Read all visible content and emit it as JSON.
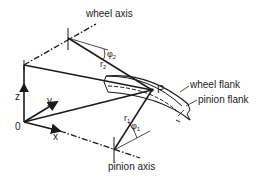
{
  "diagram": {
    "labels": {
      "wheel_axis": "wheel axis",
      "pinion_axis": "pinion axis",
      "wheel_flank": "wheel flank",
      "pinion_flank": "pinion flank",
      "point": "P",
      "origin": "0",
      "axis_x": "x",
      "axis_y": "y",
      "axis_z": "z",
      "r1": "r",
      "r1_sub": "1",
      "r2": "r",
      "r2_sub": "2",
      "phi1": "φ",
      "phi1_sub": "1",
      "phi2": "φ",
      "phi2_sub": "2"
    },
    "colors": {
      "line": "#1a1a1a",
      "background": "#ffffff"
    }
  }
}
